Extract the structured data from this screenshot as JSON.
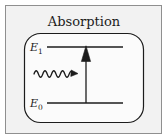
{
  "figure": {
    "title": "Absorption",
    "background_color": "#f2f2f2",
    "frame_color": "#8f8f8f",
    "ink_color": "#1c1c1c",
    "panel_fill": "#fbfbfb"
  },
  "levels": [
    {
      "name": "upper-energy-level",
      "label_base": "E",
      "label_sub": "1",
      "label_full": "E1",
      "line_y": 47,
      "line_x_start": 47,
      "line_x_end": 123
    },
    {
      "name": "lower-energy-level",
      "label_base": "E",
      "label_sub": "0",
      "label_full": "E0",
      "line_y": 103,
      "line_x_start": 47,
      "line_x_end": 123
    }
  ],
  "photon": {
    "name": "incoming-photon-wave",
    "direction": "right",
    "wave_cycles": 5,
    "x_start": 34,
    "x_end": 77,
    "y_center": 74,
    "amplitude": 5
  },
  "transition": {
    "name": "absorption-transition-arrow",
    "direction": "up",
    "x": 86,
    "y_start": 103,
    "y_end": 47,
    "arrowhead_width": 9,
    "arrowhead_height": 15
  },
  "panel": {
    "x": 24,
    "y": 33,
    "width": 120,
    "height": 90,
    "corner_radius": 16
  }
}
